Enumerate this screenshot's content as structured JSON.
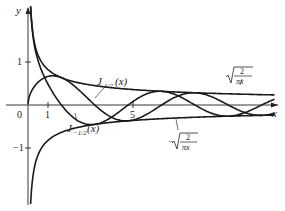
{
  "chart_data": {
    "type": "line",
    "title": "",
    "xlabel": "x",
    "ylabel": "y",
    "xlim": [
      0,
      11.5
    ],
    "ylim": [
      -2.3,
      2.2
    ],
    "x_ticks": [
      "0",
      "1",
      "5"
    ],
    "y_ticks": [
      "1",
      "-1"
    ],
    "grid": false,
    "legend": "inline annotations",
    "series": [
      {
        "name": "J_{1/2}(x)",
        "label": "J1/2(x)",
        "formula": "sqrt(2/(pi x)) sin x"
      },
      {
        "name": "J_{-1/2}(x)",
        "label": "J−1/2(x)",
        "formula": "sqrt(2/(pi x)) cos x"
      },
      {
        "name": "sqrt(2/(pi x))",
        "label": "√(2/πx)",
        "formula": "sqrt(2/(pi x))"
      },
      {
        "name": "-sqrt(2/(pi x))",
        "label": "−√(2/πx)",
        "formula": "-sqrt(2/(pi x))"
      }
    ],
    "annotations": [
      "J1/2(x)",
      "J−1/2(x)",
      "√(2/πx)",
      "−√(2/πx)"
    ]
  },
  "labels": {
    "y_axis": "y",
    "x_axis": "x",
    "origin": "0",
    "tick_x1": "1",
    "tick_x5": "5",
    "tick_y1": "1",
    "tick_ym1": "−1",
    "j_half": "J",
    "j_half_sub": "1/2",
    "j_half_arg": "(x)",
    "j_mhalf": "J",
    "j_mhalf_sub": "−1/2",
    "j_mhalf_arg": "(x)",
    "env_pos_num": "2",
    "env_pos_den": "πx",
    "env_neg_sign": "−",
    "env_neg_num": "2",
    "env_neg_den": "πx"
  }
}
